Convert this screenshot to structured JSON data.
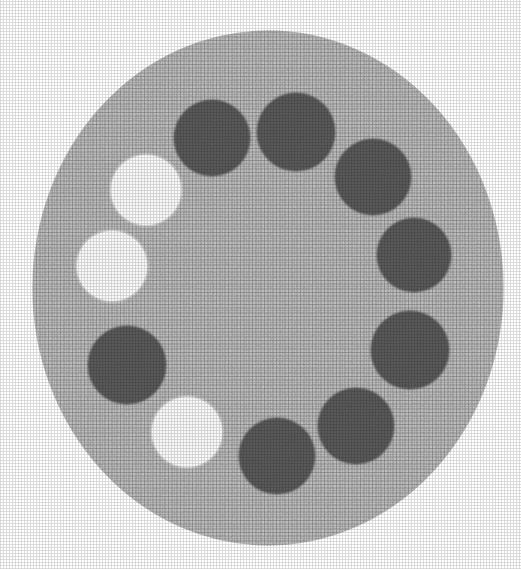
{
  "image": {
    "kind": "scanned-halftone-photograph",
    "subject": "circular gray disc containing a ring of eleven circular spots",
    "width_px": 521,
    "height_px": 569,
    "background_color": "#ffffff"
  },
  "disc": {
    "label": "textured gray disc",
    "center_x": 268,
    "center_y": 288,
    "radius_x": 235,
    "radius_y": 257,
    "fill_color": "#c9c9c9",
    "texture": "cross-hatch halftone print grain",
    "edge_color": "#b4b4b4"
  },
  "palette": {
    "disc_gray": "#c9c9c9",
    "spot_dark": "#5d5d5d",
    "spot_dark_edge": "#4a4a4a",
    "spot_light": "#fbfbfb",
    "spot_light_edge": "#e2e2e2",
    "paper_white": "#ffffff"
  },
  "spots": [
    {
      "id": "spot-01",
      "kind": "dark",
      "label": "dark spot top-left",
      "cx": 212,
      "cy": 138,
      "r": 37,
      "fill": "#5d5d5d"
    },
    {
      "id": "spot-02",
      "kind": "dark",
      "label": "dark spot top-center",
      "cx": 296,
      "cy": 132,
      "r": 38,
      "fill": "#5d5d5d"
    },
    {
      "id": "spot-03",
      "kind": "dark",
      "label": "dark spot upper-right",
      "cx": 373,
      "cy": 177,
      "r": 37,
      "fill": "#5d5d5d"
    },
    {
      "id": "spot-04",
      "kind": "dark",
      "label": "dark spot right-upper",
      "cx": 414,
      "cy": 255,
      "r": 36,
      "fill": "#5d5d5d"
    },
    {
      "id": "spot-05",
      "kind": "dark",
      "label": "dark spot right-lower",
      "cx": 410,
      "cy": 350,
      "r": 38,
      "fill": "#5d5d5d"
    },
    {
      "id": "spot-06",
      "kind": "dark",
      "label": "dark spot lower-right",
      "cx": 356,
      "cy": 426,
      "r": 37,
      "fill": "#5d5d5d"
    },
    {
      "id": "spot-07",
      "kind": "dark",
      "label": "dark spot bottom-center",
      "cx": 277,
      "cy": 456,
      "r": 37,
      "fill": "#5d5d5d"
    },
    {
      "id": "spot-08",
      "kind": "light",
      "label": "white spot bottom-left",
      "cx": 187,
      "cy": 432,
      "r": 35,
      "fill": "#fbfbfb"
    },
    {
      "id": "spot-09",
      "kind": "dark",
      "label": "dark spot left-lower",
      "cx": 127,
      "cy": 365,
      "r": 38,
      "fill": "#5d5d5d"
    },
    {
      "id": "spot-10",
      "kind": "light",
      "label": "white spot left-middle",
      "cx": 112,
      "cy": 266,
      "r": 35,
      "fill": "#fbfbfb"
    },
    {
      "id": "spot-11",
      "kind": "light",
      "label": "white spot left-upper",
      "cx": 146,
      "cy": 190,
      "r": 35,
      "fill": "#fbfbfb"
    }
  ],
  "summary": {
    "total_spots": 11,
    "dark_spots": 8,
    "light_spots": 3,
    "arrangement": "single ring around disc center"
  }
}
